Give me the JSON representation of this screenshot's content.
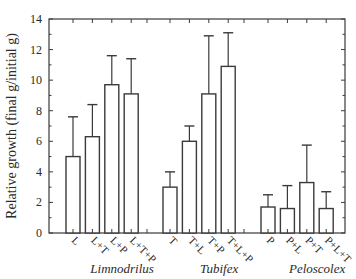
{
  "chart_data": {
    "type": "bar",
    "title": "",
    "xlabel": "",
    "ylabel": "Relative growth (final g/initial g)",
    "ylim": [
      0,
      14
    ],
    "yticks": [
      0,
      2,
      4,
      6,
      8,
      10,
      12,
      14
    ],
    "grid": false,
    "legend": null,
    "error_bars": true,
    "groups": [
      {
        "name": "Limnodrilus",
        "categories": [
          "L",
          "L+T",
          "L+P",
          "L+T+P"
        ],
        "values": [
          5.0,
          6.3,
          9.7,
          9.1
        ],
        "error_upper": [
          7.6,
          8.4,
          11.6,
          11.4
        ]
      },
      {
        "name": "Tubifex",
        "categories": [
          "T",
          "T+L",
          "T+P",
          "T+L+P"
        ],
        "values": [
          3.0,
          6.0,
          9.1,
          10.9
        ],
        "error_upper": [
          4.0,
          7.0,
          12.9,
          13.1
        ]
      },
      {
        "name": "Peloscolex",
        "categories": [
          "P",
          "P+L",
          "P+T",
          "P+L+T"
        ],
        "values": [
          1.7,
          1.6,
          3.3,
          1.6
        ],
        "error_upper": [
          2.5,
          3.1,
          5.75,
          2.7
        ]
      }
    ]
  }
}
